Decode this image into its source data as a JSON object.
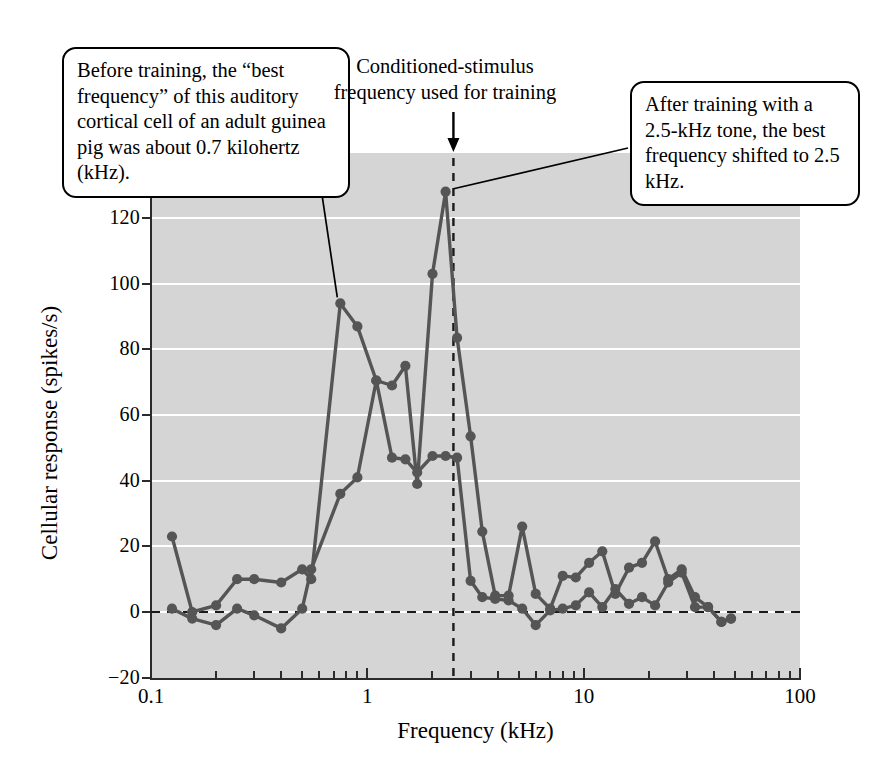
{
  "figure": {
    "background_color": "#ffffff",
    "plot_background_color": "#d5d5d5",
    "line_color": "#555555",
    "axis_color": "#2b2b2b",
    "gridline_color": "#ffffff"
  },
  "annotations": {
    "before_training": "Before training, the “best frequency” of this auditory cortical cell of an adult guinea pig was about 0.7 kilohertz (kHz).",
    "conditioned_stimulus": "Conditioned-stimulus frequency used for training",
    "after_training": "After training with a 2.5-kHz tone, the best frequency shifted to 2.5 kHz."
  },
  "chart_data": {
    "type": "line",
    "title": "",
    "xlabel": "Frequency (kHz)",
    "ylabel": "Cellular response (spikes/s)",
    "xscale": "log",
    "xlim": [
      0.1,
      100
    ],
    "ylim": [
      -20,
      130
    ],
    "yticks": [
      -20,
      0,
      20,
      40,
      60,
      80,
      100,
      120
    ],
    "ytick_labels": [
      "−20",
      "0",
      "20",
      "40",
      "60",
      "80",
      "100",
      "120"
    ],
    "xticks_major": [
      0.1,
      1,
      10,
      100
    ],
    "xtick_labels": [
      "0.1",
      "1",
      "10",
      "100"
    ],
    "grid": "horizontal-white",
    "legend": "none",
    "zero_reference_line": 0,
    "vertical_marker_x": 2.5,
    "vertical_marker_label": "Conditioned-stimulus frequency used for training",
    "series": [
      {
        "name": "Before training",
        "x": [
          0.125,
          0.155,
          0.2,
          0.25,
          0.3,
          0.4,
          0.5,
          0.55,
          0.75,
          0.9,
          1.1,
          1.3,
          1.5,
          1.7,
          2.0,
          2.3,
          2.6,
          3.0,
          3.4,
          3.9,
          4.5,
          5.2,
          6.0,
          7.0,
          8.0,
          9.2,
          10.6,
          12.2,
          14.0,
          16.2,
          18.6,
          21.4,
          24.6,
          28.4,
          32.7,
          37.6,
          43.3,
          48.0
        ],
        "y": [
          23.0,
          0.0,
          2.0,
          10.0,
          10.0,
          9.0,
          13.0,
          10.0,
          94.0,
          87.0,
          70.5,
          69.0,
          75.0,
          39.0,
          103.0,
          128.0,
          83.5,
          53.5,
          24.5,
          5.0,
          5.0,
          26.0,
          5.5,
          1.0,
          11.0,
          10.5,
          15.0,
          18.5,
          5.5,
          13.5,
          15.0,
          21.5,
          10.0,
          13.0,
          4.5,
          1.5,
          -3.0,
          -2.0
        ]
      },
      {
        "name": "After training",
        "x": [
          0.125,
          0.155,
          0.2,
          0.25,
          0.3,
          0.4,
          0.5,
          0.55,
          0.75,
          0.9,
          1.1,
          1.3,
          1.5,
          1.7,
          2.0,
          2.3,
          2.6,
          3.0,
          3.4,
          3.9,
          4.5,
          5.2,
          6.0,
          7.0,
          8.0,
          9.2,
          10.6,
          12.2,
          14.0,
          16.2,
          18.6,
          21.4,
          24.6,
          28.4,
          32.7,
          37.6,
          43.3,
          48.0
        ],
        "y": [
          1.0,
          -2.0,
          -4.0,
          1.0,
          -1.0,
          -5.0,
          1.0,
          13.0,
          36.0,
          41.0,
          70.5,
          47.0,
          46.5,
          42.5,
          47.5,
          47.5,
          47.0,
          9.5,
          4.5,
          4.0,
          3.5,
          1.0,
          -4.0,
          0.5,
          1.0,
          2.0,
          6.0,
          1.5,
          7.0,
          2.5,
          4.5,
          2.0,
          9.0,
          12.0,
          1.5,
          1.5,
          -3.0,
          -2.0
        ]
      }
    ]
  }
}
